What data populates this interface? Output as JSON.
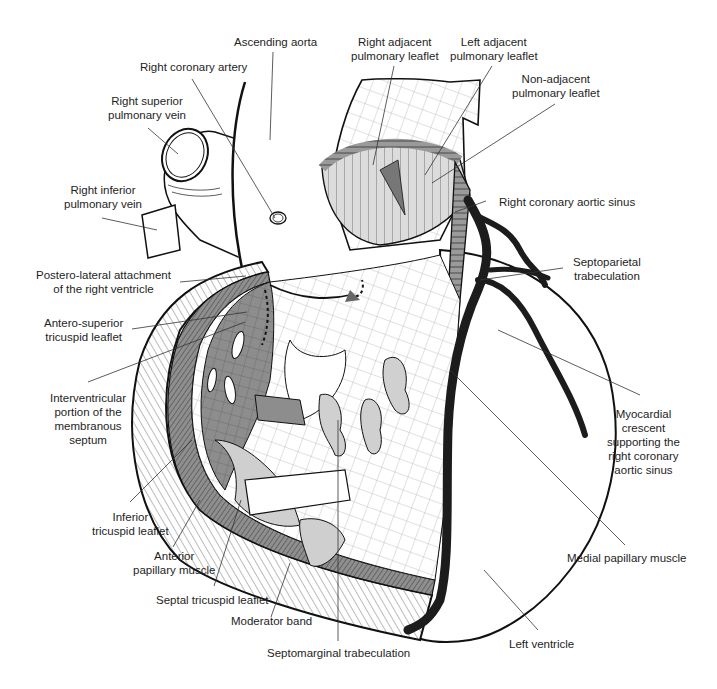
{
  "figure": {
    "type": "anatomical-illustration",
    "colors": {
      "outline": "#111111",
      "light_fill": "#d8d8d8",
      "medium_fill": "#a9a9a9",
      "dark_fill": "#8c8c8c",
      "artery": "#1c1c1c",
      "background": "#ffffff",
      "leader_line": "#333333",
      "label_text": "#1e1e1e"
    }
  },
  "labels": {
    "ascending_aorta": [
      "Ascending aorta"
    ],
    "right_coronary_artery": [
      "Right coronary artery"
    ],
    "right_superior_pulmonary_vein": [
      "Right superior",
      "pulmonary vein"
    ],
    "right_inferior_pulmonary_vein": [
      "Right inferior",
      "pulmonary vein"
    ],
    "right_adjacent_pulmonary_leaflet": [
      "Right adjacent",
      "pulmonary leaflet"
    ],
    "left_adjacent_pulmonary_leaflet": [
      "Left adjacent",
      "pulmonary leaflet"
    ],
    "non_adjacent_pulmonary_leaflet": [
      "Non-adjacent",
      "pulmonary leaflet"
    ],
    "right_coronary_aortic_sinus": [
      "Right coronary aortic sinus"
    ],
    "septoparietal_trabeculation": [
      "Septoparietal",
      "trabeculation"
    ],
    "postero_lateral_attachment": [
      "Postero-lateral attachment",
      "of the right ventricle"
    ],
    "antero_superior_tricuspid_leaflet": [
      "Antero-superior",
      "tricuspid leaflet"
    ],
    "interventricular_membranous_septum": [
      "Interventricular",
      "portion of the",
      "membranous",
      "septum"
    ],
    "myocardial_crescent": [
      "Myocardial",
      "crescent",
      "supporting the",
      "right coronary",
      "aortic sinus"
    ],
    "inferior_tricuspid_leaflet": [
      "Inferior",
      "tricuspid leaflet"
    ],
    "anterior_papillary_muscle": [
      "Anterior",
      "papillary muscle"
    ],
    "septal_tricuspid_leaflet": [
      "Septal tricuspid leaflet"
    ],
    "moderator_band": [
      "Moderator band"
    ],
    "septomarginal_trabeculation": [
      "Septomarginal trabeculation"
    ],
    "medial_papillary_muscle": [
      "Medial papillary muscle"
    ],
    "left_ventricle": [
      "Left ventricle"
    ]
  }
}
